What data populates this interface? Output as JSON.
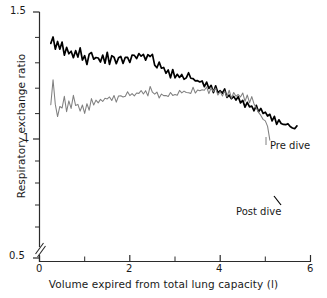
{
  "chart_data": {
    "type": "line",
    "title": "",
    "xlabel": "Volume expired from total lung capacity (l)",
    "ylabel": "Respiratory exchange ratio",
    "xlim": [
      0,
      6
    ],
    "ylim": [
      0.5,
      1.5
    ],
    "y_axis_break": true,
    "y_axis_break_note": "axis broken between 0.5 and the lowest plotted data",
    "grid": false,
    "legend_position": "inline-annotation",
    "xticks": [
      0,
      1,
      2,
      3,
      4,
      5,
      6
    ],
    "xtick_labels": [
      "0",
      "",
      "2",
      "",
      "4",
      "",
      "6"
    ],
    "yticks": [
      0.5,
      0.6,
      0.7,
      0.8,
      0.9,
      1.0,
      1.1,
      1.2,
      1.3,
      1.4,
      1.5
    ],
    "ytick_labels": [
      "0.5",
      "",
      "",
      "",
      "",
      "1",
      "",
      "",
      "",
      "",
      "1.5"
    ],
    "series": [
      {
        "name": "Post dive",
        "color": "#000000",
        "label_x": 4.45,
        "label_y": 0.795,
        "x": [
          0.25,
          0.3,
          0.35,
          0.4,
          0.45,
          0.5,
          0.55,
          0.6,
          0.65,
          0.7,
          0.75,
          0.8,
          0.85,
          0.9,
          0.95,
          1.0,
          1.05,
          1.1,
          1.15,
          1.2,
          1.25,
          1.3,
          1.35,
          1.4,
          1.45,
          1.5,
          1.55,
          1.6,
          1.65,
          1.7,
          1.75,
          1.8,
          1.85,
          1.9,
          1.95,
          2.0,
          2.05,
          2.1,
          2.15,
          2.2,
          2.25,
          2.3,
          2.35,
          2.4,
          2.45,
          2.5,
          2.55,
          2.6,
          2.65,
          2.7,
          2.75,
          2.8,
          2.85,
          2.9,
          2.95,
          3.0,
          3.05,
          3.1,
          3.15,
          3.2,
          3.25,
          3.3,
          3.35,
          3.4,
          3.45,
          3.5,
          3.55,
          3.6,
          3.65,
          3.7,
          3.75,
          3.8,
          3.85,
          3.9,
          3.95,
          4.0,
          4.05,
          4.1,
          4.15,
          4.2,
          4.25,
          4.3,
          4.35,
          4.4,
          4.45,
          4.5,
          4.55,
          4.6,
          4.65,
          4.7,
          4.75,
          4.8,
          4.85,
          4.9,
          4.95,
          5.0,
          5.05,
          5.1,
          5.15,
          5.2,
          5.25,
          5.3,
          5.35,
          5.4,
          5.45,
          5.5,
          5.55,
          5.6,
          5.65,
          5.7
        ],
        "y": [
          1.37,
          1.4,
          1.355,
          1.39,
          1.345,
          1.375,
          1.33,
          1.36,
          1.335,
          1.358,
          1.318,
          1.345,
          1.325,
          1.35,
          1.315,
          1.33,
          1.3,
          1.322,
          1.335,
          1.305,
          1.312,
          1.33,
          1.3,
          1.32,
          1.305,
          1.335,
          1.302,
          1.318,
          1.33,
          1.3,
          1.318,
          1.328,
          1.3,
          1.32,
          1.33,
          1.298,
          1.32,
          1.335,
          1.322,
          1.33,
          1.318,
          1.33,
          1.32,
          1.332,
          1.318,
          1.328,
          1.3,
          1.282,
          1.292,
          1.27,
          1.282,
          1.262,
          1.272,
          1.25,
          1.265,
          1.245,
          1.258,
          1.24,
          1.252,
          1.235,
          1.245,
          1.252,
          1.23,
          1.245,
          1.225,
          1.238,
          1.215,
          1.228,
          1.208,
          1.222,
          1.2,
          1.212,
          1.192,
          1.205,
          1.185,
          1.195,
          1.175,
          1.188,
          1.168,
          1.18,
          1.158,
          1.17,
          1.15,
          1.162,
          1.14,
          1.15,
          1.132,
          1.145,
          1.125,
          1.135,
          1.115,
          1.125,
          1.105,
          1.118,
          1.095,
          1.108,
          1.085,
          1.098,
          1.075,
          1.088,
          1.065,
          1.078,
          1.055,
          1.062,
          1.05,
          1.058,
          1.045,
          1.05,
          1.038,
          1.045
        ]
      },
      {
        "name": "Pre dive",
        "color": "#808080",
        "label_x": 5.08,
        "label_y": 1.012,
        "x": [
          0.25,
          0.3,
          0.35,
          0.4,
          0.45,
          0.5,
          0.55,
          0.6,
          0.65,
          0.7,
          0.75,
          0.8,
          0.85,
          0.9,
          0.95,
          1.0,
          1.05,
          1.1,
          1.15,
          1.2,
          1.25,
          1.3,
          1.35,
          1.4,
          1.45,
          1.5,
          1.55,
          1.6,
          1.65,
          1.7,
          1.75,
          1.8,
          1.85,
          1.9,
          1.95,
          2.0,
          2.05,
          2.1,
          2.15,
          2.2,
          2.25,
          2.3,
          2.35,
          2.4,
          2.45,
          2.5,
          2.55,
          2.6,
          2.65,
          2.7,
          2.75,
          2.8,
          2.85,
          2.9,
          2.95,
          3.0,
          3.05,
          3.1,
          3.15,
          3.2,
          3.25,
          3.3,
          3.35,
          3.4,
          3.45,
          3.5,
          3.55,
          3.6,
          3.65,
          3.7,
          3.75,
          3.8,
          3.85,
          3.9,
          3.95,
          4.0,
          4.05,
          4.1,
          4.15,
          4.2,
          4.25,
          4.3,
          4.35,
          4.4,
          4.45,
          4.5,
          4.55,
          4.6,
          4.65,
          4.7,
          4.75,
          4.8,
          4.85,
          4.9,
          4.95,
          5.0,
          5.05,
          5.1
        ],
        "y": [
          1.125,
          1.232,
          1.15,
          1.1,
          1.135,
          1.108,
          1.17,
          1.122,
          1.15,
          1.118,
          1.165,
          1.128,
          1.15,
          1.112,
          1.138,
          1.108,
          1.14,
          1.118,
          1.148,
          1.125,
          1.155,
          1.13,
          1.158,
          1.14,
          1.162,
          1.145,
          1.168,
          1.15,
          1.17,
          1.152,
          1.172,
          1.158,
          1.178,
          1.16,
          1.182,
          1.165,
          1.185,
          1.168,
          1.188,
          1.172,
          1.192,
          1.175,
          1.195,
          1.178,
          1.198,
          1.18,
          1.172,
          1.19,
          1.168,
          1.185,
          1.165,
          1.182,
          1.172,
          1.188,
          1.17,
          1.186,
          1.168,
          1.184,
          1.172,
          1.19,
          1.175,
          1.192,
          1.178,
          1.196,
          1.18,
          1.198,
          1.182,
          1.2,
          1.185,
          1.202,
          1.186,
          1.2,
          1.182,
          1.196,
          1.178,
          1.192,
          1.175,
          1.188,
          1.172,
          1.185,
          1.17,
          1.188,
          1.168,
          1.182,
          1.16,
          1.175,
          1.152,
          1.168,
          1.145,
          1.16,
          1.138,
          1.125,
          1.112,
          1.098,
          1.085,
          1.068,
          1.05,
          1.002
        ]
      }
    ]
  },
  "axis": {
    "y_title": "Respiratory exchange ratio",
    "x_title": "Volume expired from total lung capacity (l)",
    "y_tick_top": "1.5",
    "y_tick_mid": "1",
    "y_tick_bottom": "0.5",
    "x_tick_0": "0",
    "x_tick_2": "2",
    "x_tick_4": "4",
    "x_tick_6": "6"
  },
  "annotations": {
    "pre_dive": "Pre dive",
    "post_dive": "Post dive"
  }
}
